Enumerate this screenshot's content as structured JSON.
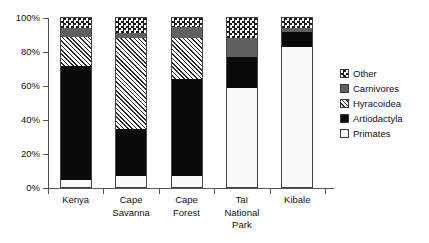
{
  "chart_data": {
    "type": "bar",
    "subtype": "stacked-100-percent",
    "title": "",
    "xlabel": "",
    "ylabel": "",
    "ylim": [
      0,
      100
    ],
    "y_unit": "%",
    "grid": false,
    "legend_position": "right",
    "y_ticks": [
      "0%",
      "20%",
      "40%",
      "60%",
      "80%",
      "100%"
    ],
    "y_tick_values": [
      0,
      20,
      40,
      60,
      80,
      100
    ],
    "categories": [
      "Kenya",
      "Cape Savanna",
      "Cape Forest",
      "Taï National Park",
      "Kibale"
    ],
    "category_lines": [
      [
        "Kenya"
      ],
      [
        "Cape",
        "Savanna"
      ],
      [
        "Cape",
        "Forest"
      ],
      [
        "Taï",
        "National",
        "Park"
      ],
      [
        "Kibale"
      ]
    ],
    "series": [
      {
        "name": "Primates",
        "pattern": "open",
        "color": "#fbfbfb",
        "values": [
          5,
          7,
          7,
          59,
          83
        ]
      },
      {
        "name": "Artiodactyla",
        "pattern": "solid-black",
        "color": "#0a0a0a",
        "values": [
          67,
          28,
          57,
          18,
          9
        ]
      },
      {
        "name": "Hyracoidea",
        "pattern": "diagonal-hatch",
        "color": "#2b2b2b",
        "values": [
          17,
          53,
          24,
          0,
          0
        ]
      },
      {
        "name": "Carnivores",
        "pattern": "solid-gray",
        "color": "#606060",
        "values": [
          5,
          3,
          7,
          11,
          2
        ]
      },
      {
        "name": "Other",
        "pattern": "checkerboard",
        "color": "#1a1a1a",
        "values": [
          6,
          9,
          5,
          12,
          6
        ]
      }
    ],
    "cumulative_tops": {
      "Kenya": {
        "Primates": 5,
        "Artiodactyla": 72,
        "Hyracoidea": 89,
        "Carnivores": 94,
        "Other": 100
      },
      "Cape Savanna": {
        "Primates": 7,
        "Artiodactyla": 35,
        "Hyracoidea": 88,
        "Carnivores": 91,
        "Other": 100
      },
      "Cape Forest": {
        "Primates": 7,
        "Artiodactyla": 64,
        "Hyracoidea": 88,
        "Carnivores": 95,
        "Other": 100
      },
      "Taï National Park": {
        "Primates": 59,
        "Artiodactyla": 77,
        "Hyracoidea": 77,
        "Carnivores": 88,
        "Other": 100
      },
      "Kibale": {
        "Primates": 83,
        "Artiodactyla": 92,
        "Hyracoidea": 92,
        "Carnivores": 94,
        "Other": 100
      }
    }
  },
  "legend": {
    "items": [
      {
        "label": "Other",
        "swatch": "checkerboard-swatch"
      },
      {
        "label": "Carnivores",
        "swatch": "gray-swatch"
      },
      {
        "label": "Hyracoidea",
        "swatch": "hatch-swatch"
      },
      {
        "label": "Artiodactyla",
        "swatch": "black-swatch"
      },
      {
        "label": "Primates",
        "swatch": "white-swatch"
      }
    ]
  }
}
